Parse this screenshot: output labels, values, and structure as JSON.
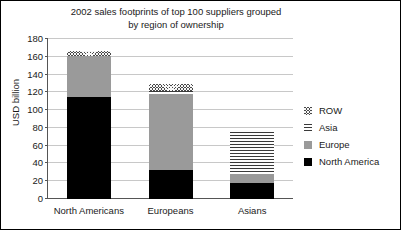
{
  "chart_data": {
    "type": "bar",
    "subtype": "stacked-vertical",
    "title": "2002 sales footprints of top 100 suppliers grouped\nby region of ownership",
    "xlabel": "",
    "ylabel": "USD billion",
    "ylim": [
      0,
      180
    ],
    "yticks": [
      0,
      20,
      40,
      60,
      80,
      100,
      120,
      140,
      160,
      180
    ],
    "ytick_labels": [
      "0",
      "20",
      "40",
      "60",
      "80",
      "100",
      "120",
      "140",
      "160",
      "180"
    ],
    "grid": true,
    "grid_axis": "y",
    "legend_position": "right",
    "categories": [
      "North Americans",
      "Europeans",
      "Asians"
    ],
    "series": [
      {
        "name": "North America",
        "color": "#000000",
        "pattern": "solid",
        "values": [
          115,
          33,
          18
        ]
      },
      {
        "name": "Europe",
        "color": "#9a9a9a",
        "pattern": "solid-gray",
        "values": [
          46,
          85,
          10
        ]
      },
      {
        "name": "Asia",
        "color": "#3a3a3a",
        "pattern": "horizontal-lines",
        "values": [
          0,
          3,
          47
        ]
      },
      {
        "name": "ROW",
        "color": "#4a4a4a",
        "pattern": "crosshatch",
        "values": [
          6,
          8,
          0
        ]
      }
    ],
    "stack_order_bottom_to_top": [
      "North America",
      "Europe",
      "Asia",
      "ROW"
    ],
    "legend_order_top_to_bottom": [
      "ROW",
      "Asia",
      "Europe",
      "North America"
    ],
    "totals": [
      167,
      129,
      75
    ]
  },
  "legend": {
    "items": [
      {
        "label": "ROW",
        "swatch": "crosshatch-swatch"
      },
      {
        "label": "Asia",
        "swatch": "horizontal-lines-swatch"
      },
      {
        "label": "Europe",
        "swatch": "gray-swatch"
      },
      {
        "label": "North America",
        "swatch": "black-swatch"
      }
    ]
  }
}
